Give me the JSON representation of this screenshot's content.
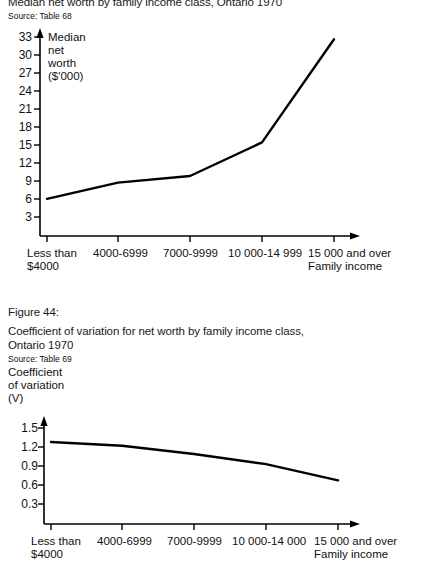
{
  "page": {
    "width": 424,
    "height": 551,
    "background": "#ffffff",
    "ink": "#000000"
  },
  "figure43": {
    "title": "Median net worth by family income class, Ontario 1970",
    "source": "Source: Table 68",
    "y_axis_title": "Median\nnet\nworth\n($'000)",
    "x_axis_title": "Family income"
  },
  "figure44": {
    "number": "Figure 44:",
    "title_line1": "Coefficient of variation for net worth by family income class,",
    "title_line2": "Ontario 1970",
    "source": "Source: Table 69",
    "y_axis_title": "Coefficient\nof variation\n(V)",
    "x_axis_title": "Family income"
  },
  "chart_data": [
    {
      "type": "line",
      "title": "Median net worth by family income class, Ontario 1970",
      "subtitle": "Source: Table 68",
      "xlabel": "Family income",
      "ylabel": "Median net worth ($'000)",
      "categories": [
        "Less than\n$4000",
        "4000-6999",
        "7000-9999",
        "10 000-14 999",
        "15 000 and over"
      ],
      "category_labels_flat": [
        "Less than $4000",
        "4000-6999",
        "7000-9999",
        "10 000-14 999",
        "15 000 and over"
      ],
      "values": [
        6.2,
        8.9,
        10.0,
        15.6,
        32.8
      ],
      "yticks": [
        3,
        6,
        9,
        12,
        15,
        18,
        21,
        24,
        27,
        30,
        33
      ],
      "ytick_labels": [
        "3",
        "6",
        "9",
        "12",
        "15",
        "18",
        "21",
        "24",
        "27",
        "30",
        "33"
      ],
      "ylim": [
        0,
        35
      ],
      "grid": false,
      "legend": "none"
    },
    {
      "type": "line",
      "title": "Coefficient of variation for net worth by family income class, Ontario 1970",
      "subtitle": "Source: Table 69",
      "xlabel": "Family income",
      "ylabel": "Coefficient of variation (V)",
      "categories": [
        "Less than\n$4000",
        "4000-6999",
        "7000-9999",
        "10 000-14 000",
        "15 000 and over"
      ],
      "category_labels_flat": [
        "Less than $4000",
        "4000-6999",
        "7000-9999",
        "10 000-14 000",
        "15 000 and over"
      ],
      "values": [
        1.28,
        1.22,
        1.09,
        0.93,
        0.67
      ],
      "yticks": [
        0.3,
        0.6,
        0.9,
        1.2,
        1.5
      ],
      "ytick_labels": [
        "0.3",
        "0.6",
        "0.9",
        "1.2",
        "1.5"
      ],
      "ylim": [
        0,
        1.6
      ],
      "grid": false,
      "legend": "none"
    }
  ],
  "fig43_yticks": {
    "t0": "33",
    "t1": "30",
    "t2": "27",
    "t3": "24",
    "t4": "21",
    "t5": "18",
    "t6": "15",
    "t7": "12",
    "t8": "9",
    "t9": "6",
    "t10": "3"
  },
  "fig43_xticks": {
    "c0a": "Less than",
    "c0b": "$4000",
    "c1": "4000-6999",
    "c2": "7000-9999",
    "c3": "10 000-14 999",
    "c4": "15 000 and over"
  },
  "fig44_yticks": {
    "t0": "1.5",
    "t1": "1.2",
    "t2": "0.9",
    "t3": "0.6",
    "t4": "0.3"
  },
  "fig44_xticks": {
    "c0a": "Less than",
    "c0b": "$4000",
    "c1": "4000-6999",
    "c2": "7000-9999",
    "c3": "10 000-14 000",
    "c4": "15 000 and over"
  }
}
